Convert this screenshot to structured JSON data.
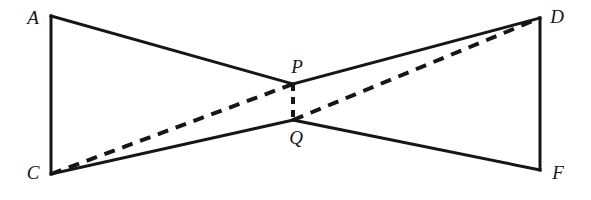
{
  "figure": {
    "type": "geometric-diagram",
    "width": 591,
    "height": 200,
    "background_color": "#ffffff",
    "stroke_color": "#161616",
    "solid_stroke_width": 3,
    "dashed_stroke_width": 4,
    "dash_pattern": "11 8",
    "vertical_dash_pattern": "7 6"
  },
  "points": {
    "A": {
      "label": "A",
      "x": 51,
      "y": 16,
      "label_x": 33,
      "label_y": 17
    },
    "C": {
      "label": "C",
      "x": 51,
      "y": 174,
      "label_x": 33,
      "label_y": 172
    },
    "D": {
      "label": "D",
      "x": 540,
      "y": 18,
      "label_x": 557,
      "label_y": 16
    },
    "F": {
      "label": "F",
      "x": 540,
      "y": 170,
      "label_x": 558,
      "label_y": 172
    },
    "P": {
      "label": "P",
      "x": 293,
      "y": 84,
      "label_x": 297,
      "label_y": 66
    },
    "Q": {
      "label": "Q",
      "x": 293,
      "y": 120,
      "label_x": 296,
      "label_y": 137
    }
  },
  "segments": {
    "solid": [
      {
        "name": "segment-A-C",
        "from": "A",
        "to": "C",
        "style": "solid"
      },
      {
        "name": "segment-A-P",
        "from": "A",
        "to": "P",
        "style": "solid"
      },
      {
        "name": "segment-P-D",
        "from": "P",
        "to": "D",
        "style": "solid"
      },
      {
        "name": "segment-D-F",
        "from": "D",
        "to": "F",
        "style": "solid"
      },
      {
        "name": "segment-C-Q",
        "from": "C",
        "to": "Q",
        "style": "solid"
      },
      {
        "name": "segment-Q-F",
        "from": "Q",
        "to": "F",
        "style": "solid"
      }
    ],
    "dashed": [
      {
        "name": "segment-C-P-dashed",
        "from": "C",
        "to": "P",
        "style": "dashed"
      },
      {
        "name": "segment-Q-D-dashed",
        "from": "Q",
        "to": "D",
        "style": "dashed"
      },
      {
        "name": "segment-P-Q-dashed",
        "from": "P",
        "to": "Q",
        "style": "dashed"
      }
    ]
  },
  "labels": {
    "A": "A",
    "C": "C",
    "D": "D",
    "F": "F",
    "P": "P",
    "Q": "Q"
  }
}
